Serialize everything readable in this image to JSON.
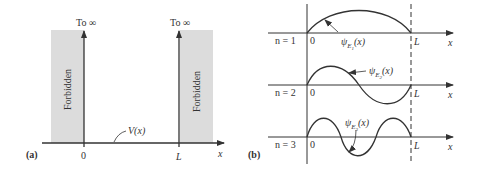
{
  "panel_a": {
    "label": "(a)",
    "left_wall_top": "To ∞",
    "right_wall_top": "To ∞",
    "left_region": "Forbidden",
    "right_region": "Forbidden",
    "potential_label": "V(x)",
    "tick_zero": "0",
    "tick_L": "L",
    "axis_label": "x",
    "colors": {
      "forbidden_fill": "#dcdcdc",
      "line": "#333333"
    }
  },
  "panel_b": {
    "label": "(b)",
    "rows": [
      {
        "n_label": "n = 1",
        "psi_base": "ψ",
        "psi_sub": "E",
        "psi_subsub": "1",
        "psi_arg": "(x)",
        "zero": "0",
        "L": "L",
        "x": "x"
      },
      {
        "n_label": "n = 2",
        "psi_base": "ψ",
        "psi_sub": "E",
        "psi_subsub": "2",
        "psi_arg": "(x)",
        "zero": "0",
        "L": "L",
        "x": "x"
      },
      {
        "n_label": "n = 3",
        "psi_base": "ψ",
        "psi_sub": "E",
        "psi_subsub": "3",
        "psi_arg": "(x)",
        "zero": "0",
        "L": "L",
        "x": "x"
      }
    ]
  }
}
